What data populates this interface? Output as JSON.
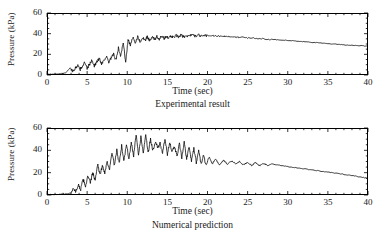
{
  "figure": {
    "panels": [
      {
        "id": "experimental",
        "caption": "Experimental result",
        "xlabel": "Time (sec)",
        "ylabel": "Pressure (kPa)"
      },
      {
        "id": "numerical",
        "caption": "Numerical prediction",
        "xlabel": "Time (sec)",
        "ylabel": "Pressure (kPa)"
      }
    ],
    "line_color": "#000000",
    "axis_color": "#000000"
  },
  "chart_data": [
    {
      "type": "line",
      "title": "Experimental result",
      "xlabel": "Time (sec)",
      "ylabel": "Pressure (kPa)",
      "xlim": [
        0,
        40
      ],
      "ylim": [
        0,
        60
      ],
      "xticks": [
        0,
        5,
        10,
        15,
        20,
        25,
        30,
        35,
        40
      ],
      "yticks": [
        0,
        20,
        40,
        60
      ],
      "x_minor_interval": 1,
      "y_minor_interval": 5,
      "grid": false,
      "legend": null,
      "series": [
        {
          "name": "Experimental pressure",
          "x": [
            0.0,
            0.5,
            1.0,
            1.5,
            2.0,
            2.3,
            2.6,
            2.9,
            3.2,
            3.5,
            3.8,
            4.1,
            4.4,
            4.7,
            5.0,
            5.3,
            5.6,
            5.9,
            6.2,
            6.5,
            6.8,
            7.1,
            7.4,
            7.7,
            8.0,
            8.3,
            8.6,
            8.9,
            9.2,
            9.5,
            9.8,
            10.1,
            10.4,
            10.7,
            11.0,
            11.3,
            11.6,
            11.9,
            12.2,
            12.5,
            12.8,
            13.1,
            13.4,
            13.7,
            14.0,
            14.3,
            14.6,
            14.9,
            15.2,
            15.5,
            15.8,
            16.1,
            16.4,
            16.7,
            17.0,
            17.5,
            18.0,
            18.5,
            19.0,
            19.5,
            20.0,
            20.5,
            21.0,
            21.5,
            22.0,
            22.5,
            23.0,
            23.5,
            24.0,
            25.0,
            26.0,
            27.0,
            28.0,
            29.0,
            30.0,
            31.0,
            32.0,
            33.0,
            34.0,
            35.0,
            36.0,
            37.0,
            38.0,
            39.0,
            40.0
          ],
          "y": [
            0.5,
            0.8,
            1.0,
            1.2,
            1.5,
            2.0,
            4.5,
            7.0,
            3.5,
            6.0,
            9.5,
            5.0,
            8.5,
            12.0,
            6.0,
            10.5,
            14.0,
            9.0,
            12.5,
            16.0,
            11.0,
            14.5,
            18.0,
            12.0,
            16.5,
            20.0,
            14.0,
            26.0,
            18.0,
            32.0,
            12.0,
            34.0,
            29.0,
            36.0,
            31.0,
            37.0,
            32.0,
            36.5,
            33.0,
            37.0,
            33.5,
            37.5,
            34.0,
            37.0,
            34.5,
            37.5,
            35.0,
            38.0,
            35.5,
            38.0,
            36.0,
            38.5,
            36.5,
            38.5,
            37.0,
            38.0,
            38.5,
            38.0,
            38.5,
            38.0,
            38.5,
            38.0,
            38.0,
            37.5,
            37.5,
            37.0,
            37.0,
            36.5,
            36.5,
            36.0,
            35.5,
            35.0,
            34.5,
            34.0,
            33.5,
            32.8,
            32.2,
            31.6,
            31.0,
            30.4,
            29.8,
            29.2,
            28.8,
            28.4,
            28.0
          ]
        }
      ]
    },
    {
      "type": "line",
      "title": "Numerical prediction",
      "xlabel": "Time (sec)",
      "ylabel": "Pressure (kPa)",
      "xlim": [
        0,
        40
      ],
      "ylim": [
        0,
        60
      ],
      "xticks": [
        0,
        5,
        10,
        15,
        20,
        25,
        30,
        35,
        40
      ],
      "yticks": [
        0,
        20,
        40,
        60
      ],
      "x_minor_interval": 1,
      "y_minor_interval": 5,
      "grid": false,
      "legend": null,
      "series": [
        {
          "name": "Numerical pressure",
          "x": [
            0.0,
            0.5,
            1.0,
            1.5,
            2.0,
            2.5,
            3.0,
            3.3,
            3.6,
            3.9,
            4.2,
            4.5,
            4.8,
            5.1,
            5.4,
            5.7,
            6.0,
            6.3,
            6.6,
            6.9,
            7.2,
            7.5,
            7.8,
            8.1,
            8.4,
            8.7,
            9.0,
            9.3,
            9.6,
            9.9,
            10.2,
            10.5,
            10.8,
            11.1,
            11.4,
            11.7,
            12.0,
            12.3,
            12.6,
            12.9,
            13.2,
            13.5,
            13.8,
            14.1,
            14.4,
            14.7,
            15.0,
            15.3,
            15.6,
            15.9,
            16.2,
            16.5,
            16.8,
            17.1,
            17.4,
            17.7,
            18.0,
            18.3,
            18.6,
            18.9,
            19.2,
            19.5,
            19.8,
            20.2,
            20.6,
            21.0,
            21.5,
            22.0,
            22.5,
            23.0,
            23.5,
            24.0,
            24.5,
            25.0,
            25.5,
            26.0,
            26.5,
            27.0,
            27.5,
            28.0,
            29.0,
            30.0,
            31.0,
            32.0,
            33.0,
            34.0,
            35.0,
            36.0,
            37.0,
            38.0,
            39.0,
            40.0
          ],
          "y": [
            0.3,
            0.4,
            0.5,
            0.6,
            0.8,
            1.0,
            2.0,
            6.0,
            3.0,
            9.0,
            5.0,
            14.0,
            8.0,
            17.0,
            11.0,
            20.0,
            13.0,
            28.0,
            18.0,
            26.0,
            20.0,
            30.0,
            23.0,
            38.0,
            26.0,
            40.0,
            28.0,
            44.0,
            30.0,
            46.0,
            32.0,
            47.0,
            35.0,
            54.0,
            36.0,
            52.0,
            38.0,
            55.0,
            37.0,
            50.0,
            40.0,
            48.0,
            42.0,
            46.0,
            38.0,
            50.0,
            36.0,
            48.0,
            38.0,
            44.0,
            34.0,
            46.0,
            33.0,
            47.0,
            32.0,
            44.0,
            30.0,
            42.0,
            29.0,
            40.0,
            28.0,
            36.0,
            27.0,
            34.0,
            28.0,
            32.0,
            27.0,
            31.0,
            27.5,
            30.5,
            28.0,
            30.0,
            27.0,
            29.5,
            26.5,
            29.0,
            26.0,
            28.5,
            26.0,
            28.0,
            26.5,
            25.5,
            24.5,
            23.5,
            22.5,
            21.5,
            20.5,
            19.5,
            18.5,
            17.5,
            16.2,
            15.0
          ]
        }
      ]
    }
  ]
}
